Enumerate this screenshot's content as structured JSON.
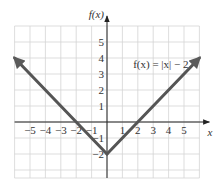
{
  "chart_data": {
    "type": "line",
    "title": "",
    "xlabel": "x",
    "ylabel": "f(x)",
    "annotation": "f(x) = |x| − 2",
    "xlim": [
      -6,
      6
    ],
    "ylim": [
      -3.5,
      6
    ],
    "grid": true,
    "x_ticks": [
      -5,
      -4,
      -3,
      -2,
      -1,
      1,
      2,
      3,
      4,
      5
    ],
    "x_tick_labels": [
      "−5",
      "−4",
      "−3",
      "−2",
      "−1",
      "1",
      "2",
      "3",
      "4",
      "5"
    ],
    "y_ticks": [
      -2,
      -1,
      1,
      2,
      3,
      4,
      5
    ],
    "y_tick_labels": [
      "−2",
      "−1",
      "1",
      "2",
      "3",
      "4",
      "5"
    ],
    "series": [
      {
        "name": "f(x) = |x| - 2",
        "color": "#555555",
        "x": [
          -6,
          0,
          6
        ],
        "y": [
          4,
          -2,
          4
        ],
        "arrows": "both-ends"
      }
    ]
  },
  "colors": {
    "grid": "#d4d4d4",
    "axis": "#222222",
    "line": "#5a5a5a"
  }
}
